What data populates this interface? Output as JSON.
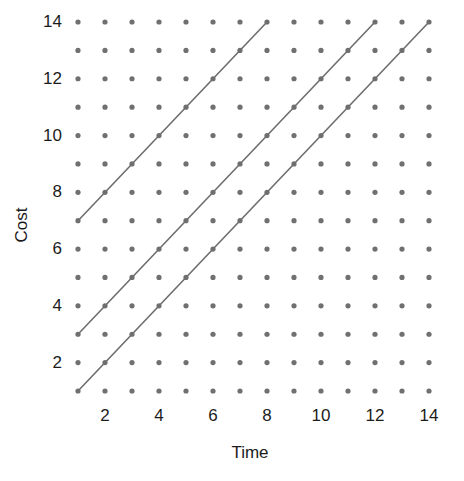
{
  "chart_data": {
    "type": "scatter",
    "title": "",
    "subtitle": "",
    "xlabel": "Time",
    "ylabel": "Cost",
    "xlim": [
      1,
      14
    ],
    "ylim": [
      1,
      14
    ],
    "grid": false,
    "legend": "none",
    "x_ticks": [
      2,
      4,
      6,
      8,
      10,
      12,
      14
    ],
    "y_ticks": [
      2,
      4,
      6,
      8,
      10,
      12,
      14
    ],
    "x_tick_labels": [
      "2",
      "4",
      "6",
      "8",
      "10",
      "12",
      "14"
    ],
    "y_tick_labels": [
      "2",
      "4",
      "6",
      "8",
      "10",
      "12",
      "14"
    ],
    "lattice": {
      "description": "Integer lattice of dots at every (x,y) with x from 1 to 14 and y from 1 to 14",
      "x_values": [
        1,
        2,
        3,
        4,
        5,
        6,
        7,
        8,
        9,
        10,
        11,
        12,
        13,
        14
      ],
      "y_values": [
        1,
        2,
        3,
        4,
        5,
        6,
        7,
        8,
        9,
        10,
        11,
        12,
        13,
        14
      ],
      "dot_color": "#707070",
      "dot_radius": 2.6
    },
    "series": [
      {
        "name": "line-1",
        "slope": 1,
        "intercept": 6,
        "start": [
          1,
          7
        ],
        "end": [
          8,
          14
        ],
        "color": "#6e6e6e",
        "width": 1.6
      },
      {
        "name": "line-2",
        "slope": 1,
        "intercept": 2,
        "start": [
          1,
          3
        ],
        "end": [
          12,
          14
        ],
        "color": "#6e6e6e",
        "width": 1.6
      },
      {
        "name": "line-3",
        "slope": 1,
        "intercept": 0,
        "start": [
          1,
          1
        ],
        "end": [
          14,
          14
        ],
        "color": "#6e6e6e",
        "width": 1.6
      }
    ],
    "colors": {
      "background": "#ffffff",
      "text": "#1c1c1c",
      "dot": "#707070",
      "line": "#6e6e6e"
    }
  },
  "axes": {
    "x_title": "Time",
    "y_title": "Cost"
  }
}
